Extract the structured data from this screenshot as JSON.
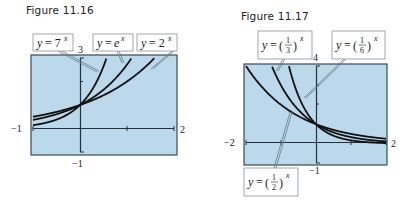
{
  "figures": [
    {
      "title": "Figure 11.16",
      "labels": [
        "y = 7^x",
        "y = e^x",
        "y = 2^x"
      ],
      "ticks": {
        "xmin": "−1",
        "xmax": "2",
        "ymax": "3",
        "ymin": "−1"
      }
    },
    {
      "title": "Figure 11.17",
      "labels": [
        "y = (1/3)^x",
        "y = (1/6)^x",
        "y = (1/2)^x"
      ],
      "ticks": {
        "xmin": "−2",
        "xmax": "2",
        "ymax": "4",
        "ymin": "−1"
      }
    }
  ],
  "colors": {
    "plot_bg": "#bcd9ec",
    "curve": "#111111",
    "frame": "#3a4a55"
  },
  "chart_data": [
    {
      "type": "line",
      "title": "Figure 11.16",
      "xlabel": "",
      "ylabel": "",
      "xlim": [
        -1,
        2
      ],
      "ylim": [
        -1,
        3
      ],
      "grid": false,
      "series": [
        {
          "name": "y = 7^x",
          "function": "7^x"
        },
        {
          "name": "y = e^x",
          "function": "e^x"
        },
        {
          "name": "y = 2^x",
          "function": "2^x"
        }
      ],
      "annotations": [
        "all curves pass through (0, 1)"
      ]
    },
    {
      "type": "line",
      "title": "Figure 11.17",
      "xlabel": "",
      "ylabel": "",
      "xlim": [
        -2,
        2
      ],
      "ylim": [
        -1,
        4
      ],
      "grid": false,
      "series": [
        {
          "name": "y = (1/3)^x",
          "function": "(1/3)^x"
        },
        {
          "name": "y = (1/6)^x",
          "function": "(1/6)^x"
        },
        {
          "name": "y = (1/2)^x",
          "function": "(1/2)^x"
        }
      ],
      "annotations": [
        "all curves pass through (0, 1)"
      ]
    }
  ]
}
